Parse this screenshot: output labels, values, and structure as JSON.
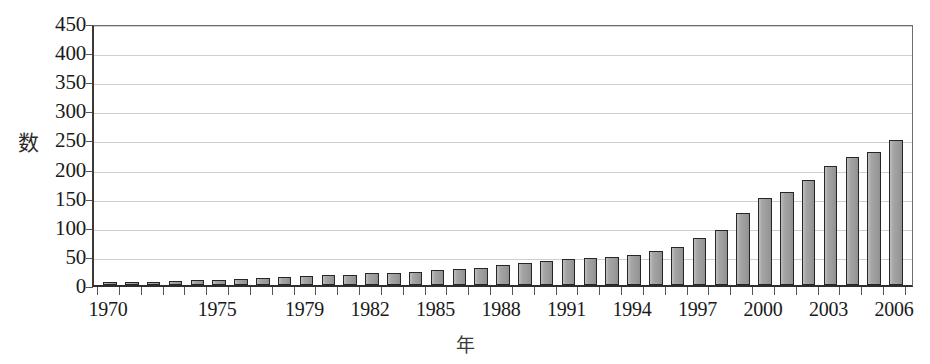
{
  "chart_data": {
    "type": "bar",
    "title": "",
    "xlabel": "年",
    "ylabel": "数",
    "ylim": [
      0,
      450
    ],
    "ytick_step": 50,
    "grid": true,
    "legend": null,
    "bar_fill_color": "#a3a3a3",
    "bar_border_color": "#262626",
    "gridline_color": "#cfcfcf",
    "axis_color": "#2e2e2e",
    "ytick_labels": [
      "450",
      "400",
      "350",
      "300",
      "250",
      "200",
      "150",
      "100",
      "50",
      "0"
    ],
    "ytick_values": [
      450,
      400,
      350,
      300,
      250,
      200,
      150,
      100,
      50,
      0
    ],
    "xtick_labels": [
      "1970",
      "1975",
      "1979",
      "1982",
      "1985",
      "1988",
      "1991",
      "1994",
      "1997",
      "2000",
      "2003",
      "2006"
    ],
    "xtick_years": [
      1970,
      1975,
      1979,
      1982,
      1985,
      1988,
      1991,
      1994,
      1997,
      2000,
      2003,
      2006
    ],
    "categories": [
      "1970",
      "1971",
      "1972",
      "1973",
      "1974",
      "1975",
      "1976",
      "1977",
      "1978",
      "1979",
      "1980",
      "1981",
      "1982",
      "1983",
      "1984",
      "1985",
      "1986",
      "1987",
      "1988",
      "1989",
      "1990",
      "1991",
      "1992",
      "1993",
      "1994",
      "1995",
      "1996",
      "1997",
      "1998",
      "1999",
      "2000",
      "2001",
      "2002",
      "2003",
      "2004",
      "2005",
      "2006"
    ],
    "values": [
      5,
      6,
      6,
      7,
      8,
      9,
      11,
      12,
      13,
      15,
      17,
      18,
      20,
      21,
      23,
      25,
      27,
      30,
      34,
      37,
      42,
      45,
      47,
      48,
      52,
      58,
      65,
      80,
      95,
      124,
      150,
      160,
      180,
      205,
      220,
      228,
      249
    ]
  }
}
